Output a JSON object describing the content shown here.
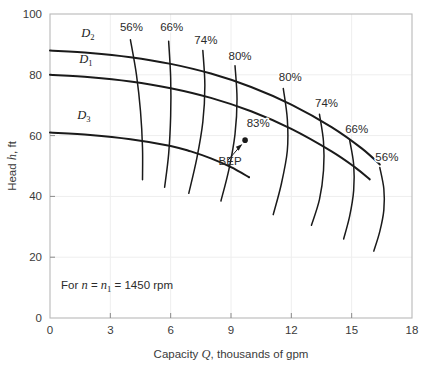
{
  "chart_data": {
    "type": "line",
    "title": "",
    "xlabel": "Capacity Q, thousands of gpm",
    "ylabel": "Head h, ft",
    "xlim": [
      0,
      18
    ],
    "ylim": [
      0,
      100
    ],
    "xticks": [
      "0",
      "3",
      "6",
      "9",
      "12",
      "15",
      "18"
    ],
    "yticks": [
      "0",
      "20",
      "40",
      "60",
      "80",
      "100"
    ],
    "grid": true,
    "legend": "none",
    "annotation": "For n = n1 = 1450 rpm",
    "annotation_parts": {
      "prefix": "For ",
      "var1": "n",
      "eq1": " = ",
      "var2": "n",
      "sub2": "1",
      "eq2": " = ",
      "value": "1450 rpm"
    },
    "bep": {
      "label": "BEP",
      "efficiency_label": "83%",
      "q": 9.7,
      "h": 58.5
    },
    "head_curves": [
      {
        "name": "D2",
        "label": "D",
        "subscript": "2",
        "points": [
          [
            0,
            88.0
          ],
          [
            2,
            87.2
          ],
          [
            4,
            85.8
          ],
          [
            6,
            83.6
          ],
          [
            8,
            80.4
          ],
          [
            10,
            76.0
          ],
          [
            12,
            70.2
          ],
          [
            14,
            62.8
          ],
          [
            15.5,
            55.8
          ],
          [
            16.4,
            50.5
          ]
        ]
      },
      {
        "name": "D1",
        "label": "D",
        "subscript": "1",
        "points": [
          [
            0,
            80.0
          ],
          [
            2,
            79.2
          ],
          [
            4,
            77.8
          ],
          [
            6,
            75.6
          ],
          [
            8,
            72.4
          ],
          [
            10,
            68.0
          ],
          [
            12,
            62.2
          ],
          [
            14,
            54.8
          ],
          [
            15.2,
            49.4
          ],
          [
            15.9,
            45.6
          ]
        ]
      },
      {
        "name": "D3",
        "label": "D",
        "subscript": "3",
        "points": [
          [
            0,
            61.0
          ],
          [
            2,
            60.2
          ],
          [
            4,
            58.8
          ],
          [
            6,
            56.6
          ],
          [
            7,
            54.8
          ],
          [
            8,
            52.5
          ],
          [
            9,
            49.6
          ],
          [
            9.9,
            46.3
          ]
        ]
      }
    ],
    "efficiency_curves": [
      {
        "label": "56%",
        "side": "left",
        "points": [
          [
            4.0,
            91.5
          ],
          [
            4.3,
            80.0
          ],
          [
            4.5,
            68.0
          ],
          [
            4.6,
            56.0
          ],
          [
            4.6,
            45.5
          ]
        ]
      },
      {
        "label": "66%",
        "side": "left",
        "points": [
          [
            5.9,
            91.0
          ],
          [
            6.0,
            79.0
          ],
          [
            6.0,
            66.5
          ],
          [
            5.9,
            54.0
          ],
          [
            5.7,
            43.0
          ]
        ]
      },
      {
        "label": "74%",
        "side": "left",
        "points": [
          [
            7.6,
            88.0
          ],
          [
            7.7,
            76.5
          ],
          [
            7.6,
            64.5
          ],
          [
            7.3,
            52.5
          ],
          [
            6.9,
            41.0
          ]
        ]
      },
      {
        "label": "80%",
        "side": "left",
        "points": [
          [
            9.2,
            83.0
          ],
          [
            9.3,
            72.0
          ],
          [
            9.2,
            60.5
          ],
          [
            8.9,
            49.0
          ],
          [
            8.5,
            38.5
          ]
        ]
      },
      {
        "label": "80%",
        "side": "right",
        "points": [
          [
            11.6,
            75.5
          ],
          [
            11.8,
            65.5
          ],
          [
            11.8,
            55.0
          ],
          [
            11.5,
            44.0
          ],
          [
            11.1,
            34.0
          ]
        ]
      },
      {
        "label": "74%",
        "side": "right",
        "points": [
          [
            13.4,
            67.0
          ],
          [
            13.6,
            58.0
          ],
          [
            13.6,
            48.5
          ],
          [
            13.4,
            39.0
          ],
          [
            13.0,
            30.5
          ]
        ]
      },
      {
        "label": "66%",
        "side": "right",
        "points": [
          [
            14.9,
            58.5
          ],
          [
            15.1,
            50.5
          ],
          [
            15.1,
            42.0
          ],
          [
            14.9,
            33.5
          ],
          [
            14.6,
            26.0
          ]
        ]
      },
      {
        "label": "56%",
        "side": "right",
        "points": [
          [
            16.4,
            49.5
          ],
          [
            16.6,
            42.5
          ],
          [
            16.6,
            35.5
          ],
          [
            16.4,
            28.5
          ],
          [
            16.1,
            22.0
          ]
        ]
      }
    ],
    "efficiency_label_positions": [
      {
        "label": "56%",
        "x": 4.05,
        "y": 94.5,
        "anchor": "middle"
      },
      {
        "label": "66%",
        "x": 6.05,
        "y": 94.5,
        "anchor": "middle"
      },
      {
        "label": "74%",
        "x": 7.75,
        "y": 90.0,
        "anchor": "middle"
      },
      {
        "label": "80%",
        "x": 9.45,
        "y": 85.0,
        "anchor": "middle"
      },
      {
        "label": "83%",
        "x": 10.35,
        "y": 62.8,
        "anchor": "middle"
      },
      {
        "label": "80%",
        "x": 11.95,
        "y": 78.0,
        "anchor": "middle"
      },
      {
        "label": "74%",
        "x": 13.75,
        "y": 69.5,
        "anchor": "middle"
      },
      {
        "label": "66%",
        "x": 15.25,
        "y": 61.0,
        "anchor": "middle"
      },
      {
        "label": "56%",
        "x": 16.75,
        "y": 51.5,
        "anchor": "middle"
      }
    ],
    "diameter_label_positions": [
      {
        "name": "D2",
        "x": 1.55,
        "y": 92.5
      },
      {
        "name": "D1",
        "x": 1.45,
        "y": 84.0
      },
      {
        "name": "D3",
        "x": 1.35,
        "y": 65.5
      }
    ],
    "colors": {
      "curve": "#1a1a1a",
      "frame": "#b9b9b9",
      "grid": "#eeeeee",
      "text": "#3a3a3a",
      "background": "#ffffff"
    }
  }
}
